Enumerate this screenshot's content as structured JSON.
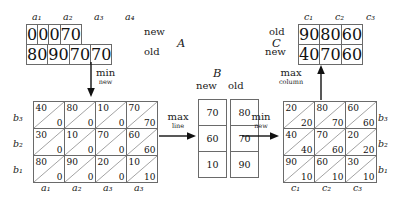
{
  "matrix_a": {
    "name": "A",
    "col_labels": [
      "a₁",
      "a₂",
      "a₃",
      "a₄"
    ],
    "row_labels": [
      "new",
      "old"
    ],
    "rows": [
      [
        "0",
        "0",
        "0",
        "70"
      ],
      [
        "80",
        "90",
        "70",
        "70"
      ]
    ]
  },
  "matrix_c": {
    "name": "C",
    "col_labels": [
      "c₁",
      "c₂",
      "c₃"
    ],
    "row_labels": [
      "old",
      "new"
    ],
    "rows": [
      [
        "90",
        "80",
        "60"
      ],
      [
        "40",
        "70",
        "60"
      ]
    ]
  },
  "matrix_b": {
    "name": "B",
    "col_labels": [
      "new",
      "old"
    ],
    "new_column": [
      "70",
      "60",
      "10"
    ],
    "old_column": [
      "80",
      "70",
      "90"
    ]
  },
  "matrix_left": {
    "row_labels": [
      "b₃",
      "b₂",
      "b₁"
    ],
    "col_labels": [
      "a₁",
      "a₂",
      "a₃",
      "a₃"
    ],
    "rows": [
      [
        {
          "top": "40",
          "bottom": "0"
        },
        {
          "top": "80",
          "bottom": "0"
        },
        {
          "top": "10",
          "bottom": "0"
        },
        {
          "top": "70",
          "bottom": "70"
        }
      ],
      [
        {
          "top": "30",
          "bottom": "0"
        },
        {
          "top": "10",
          "bottom": "0"
        },
        {
          "top": "70",
          "bottom": "0"
        },
        {
          "top": "60",
          "bottom": "60"
        }
      ],
      [
        {
          "top": "80",
          "bottom": "0"
        },
        {
          "top": "90",
          "bottom": "0"
        },
        {
          "top": "20",
          "bottom": "0"
        },
        {
          "top": "10",
          "bottom": "10"
        }
      ]
    ]
  },
  "matrix_right": {
    "row_labels": [
      "b₃",
      "b₂",
      "b₁"
    ],
    "col_labels": [
      "c₁",
      "c₂",
      "c₃"
    ],
    "rows": [
      [
        {
          "top": "20",
          "bottom": "20"
        },
        {
          "top": "80",
          "bottom": "70"
        },
        {
          "top": "60",
          "bottom": "60"
        }
      ],
      [
        {
          "top": "40",
          "bottom": "40"
        },
        {
          "top": "70",
          "bottom": "60"
        },
        {
          "top": "20",
          "bottom": "20"
        }
      ],
      [
        {
          "top": "90",
          "bottom": "10"
        },
        {
          "top": "60",
          "bottom": "10"
        },
        {
          "top": "30",
          "bottom": "10"
        }
      ]
    ]
  },
  "operations": {
    "min_new_down": {
      "main": "min",
      "sub": "new"
    },
    "max_line": {
      "main": "max",
      "sub": "line"
    },
    "min_new_right": {
      "main": "min",
      "sub": "new"
    },
    "max_column": {
      "main": "max",
      "sub": "column"
    }
  }
}
